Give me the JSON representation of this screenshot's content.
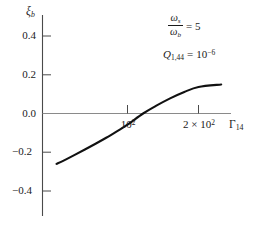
{
  "chart_data": {
    "type": "line",
    "title": "",
    "xlabel": "Γ_14",
    "ylabel": "ξ_b",
    "xlim": [
      0,
      240
    ],
    "ylim": [
      -0.5,
      0.5
    ],
    "grid": false,
    "legend": "none",
    "x": [
      0,
      10,
      25,
      40,
      55,
      70,
      85,
      100,
      122,
      140,
      160,
      180,
      200,
      232
    ],
    "y": [
      -0.26,
      -0.243,
      -0.215,
      -0.186,
      -0.156,
      -0.125,
      -0.092,
      -0.058,
      0.0,
      0.039,
      0.078,
      0.111,
      0.137,
      0.15
    ],
    "series": [
      {
        "name": "xi_b",
        "values": [
          -0.26,
          -0.243,
          -0.215,
          -0.186,
          -0.156,
          -0.125,
          -0.092,
          -0.058,
          0.0,
          0.039,
          0.078,
          0.111,
          0.137,
          0.15
        ]
      }
    ],
    "x_ticks": [
      {
        "value": 100,
        "label_main": "10",
        "label_sup": "2",
        "prefix": ""
      },
      {
        "value": 200,
        "label_main": "10",
        "label_sup": "2",
        "prefix": "2 × "
      }
    ],
    "y_ticks": [
      {
        "value": 0.4,
        "label": "0.4"
      },
      {
        "value": 0.2,
        "label": "0.2"
      },
      {
        "value": 0.0,
        "label": "0.0"
      },
      {
        "value": -0.2,
        "label": "−0.2"
      },
      {
        "value": -0.4,
        "label": "−0.4"
      }
    ],
    "annotations": [
      {
        "id": "omega-ratio",
        "numerator": "ω",
        "numerator_sub": "s",
        "denominator": "ω",
        "denominator_sub": "b",
        "relation": "= 5",
        "text": "ω_s/ω_b = 5"
      },
      {
        "id": "q-value",
        "symbol": "Q",
        "symbol_sub": "1,44",
        "relation": "=",
        "value_base": "10",
        "value_exp": "−6",
        "text": "Q_1,44 = 10^−6"
      }
    ],
    "curve_color": "#111111",
    "axis_color": "#4a4a4a",
    "zero_line_color": "#8a8a8a"
  },
  "axes": {
    "y_axis_label": {
      "symbol": "ξ",
      "subscript": "b"
    },
    "x_axis_label": {
      "symbol": "Γ",
      "subscript": "14"
    }
  }
}
